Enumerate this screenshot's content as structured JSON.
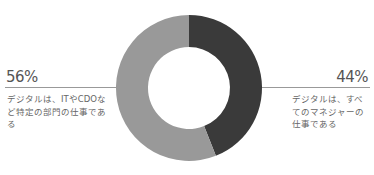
{
  "chart_data": {
    "type": "pie",
    "variant": "donut",
    "title": "",
    "series": [
      {
        "name": "デジタルは、すべてのマネジャーの仕事である",
        "value": 44,
        "label": "44%",
        "color": "#3a3a3a"
      },
      {
        "name": "デジタルは、ITやCDOなど特定の部門の仕事である",
        "value": 56,
        "label": "56%",
        "color": "#999999"
      }
    ],
    "start_angle": "12 o'clock",
    "direction": "clockwise"
  },
  "left": {
    "percent": "56%",
    "text": "デジタルは、ITやCDOなど特定の部門の仕事である"
  },
  "right": {
    "percent": "44%",
    "text": "デジタルは、すべてのマネジャーの仕事である"
  }
}
